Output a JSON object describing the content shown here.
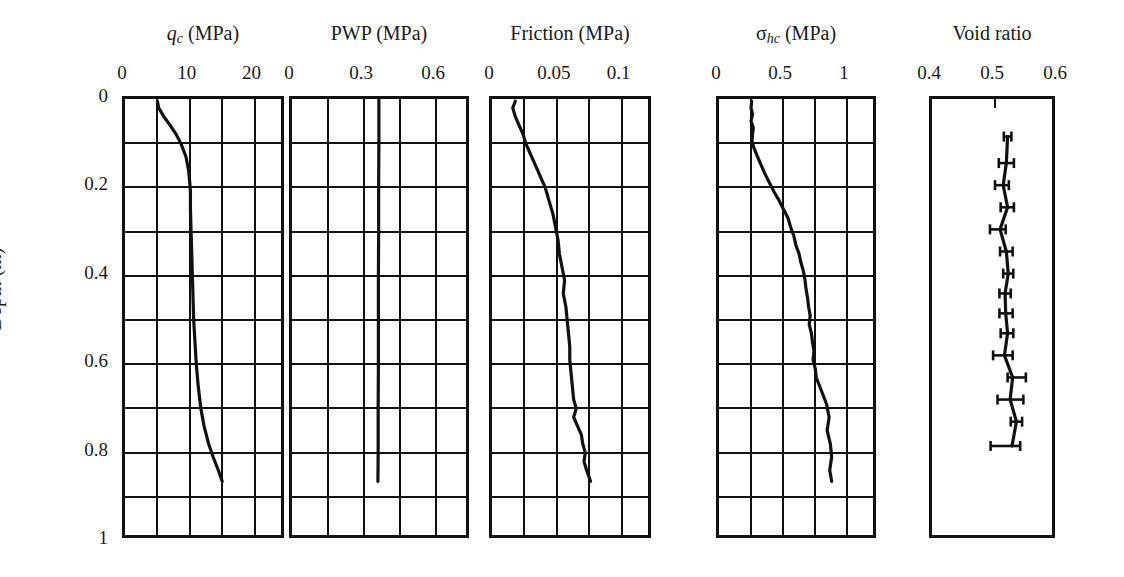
{
  "figure": {
    "y_axis_title": "Depth (m)",
    "y_ticks": [
      "0",
      "0.2",
      "0.4",
      "0.6",
      "0.8",
      "1"
    ],
    "y_tick_values": [
      0,
      0.2,
      0.4,
      0.6,
      0.8,
      1.0
    ]
  },
  "panels": [
    {
      "key": "qc",
      "title_html": "qc (MPa)",
      "title_main": "q",
      "title_sub": "c",
      "title_unit": " (MPa)",
      "x_ticks": [
        "0",
        "10",
        "20"
      ],
      "x_tick_values": [
        0,
        10,
        20
      ],
      "x_min": 0,
      "x_max": 25,
      "grid_x_step": 5,
      "grid_y_step": 0.1
    },
    {
      "key": "pwp",
      "title_html": "PWP (MPa)",
      "title_main": "PWP",
      "title_sub": "",
      "title_unit": " (MPa)",
      "x_ticks": [
        "0",
        "0.3",
        "0.6"
      ],
      "x_tick_values": [
        0,
        0.3,
        0.6
      ],
      "x_min": 0,
      "x_max": 0.75,
      "grid_x_step": 0.15,
      "grid_y_step": 0.1
    },
    {
      "key": "friction",
      "title_html": "Friction (MPa)",
      "title_main": "Friction",
      "title_sub": "",
      "title_unit": " (MPa)",
      "x_ticks": [
        "0",
        "0.05",
        "0.1"
      ],
      "x_tick_values": [
        0,
        0.05,
        0.1
      ],
      "x_min": 0,
      "x_max": 0.125,
      "grid_x_step": 0.025,
      "grid_y_step": 0.1
    },
    {
      "key": "sigma_hc",
      "title_html": "σhc (MPa)",
      "title_main": "σ",
      "title_sub": "hc",
      "title_unit": " (MPa)",
      "x_ticks": [
        "0",
        "0.5",
        "1"
      ],
      "x_tick_values": [
        0,
        0.5,
        1
      ],
      "x_min": 0,
      "x_max": 1.25,
      "grid_x_step": 0.25,
      "grid_y_step": 0.1
    },
    {
      "key": "void_ratio",
      "title_html": "Void ratio",
      "title_main": "Void ratio",
      "title_sub": "",
      "title_unit": "",
      "x_ticks": [
        "0.4",
        "0.5",
        "0.6"
      ],
      "x_tick_values": [
        0.4,
        0.5,
        0.6
      ],
      "x_min": 0.4,
      "x_max": 0.6,
      "grid_x_step": 0,
      "grid_y_step": 0
    }
  ],
  "chart_data": [
    {
      "type": "line",
      "title": "qc (MPa)",
      "xlabel": "qc (MPa)",
      "ylabel": "Depth (m)",
      "xlim": [
        0,
        25
      ],
      "ylim": [
        0,
        1
      ],
      "y_inverted": true,
      "grid": true,
      "xticks": [
        0,
        10,
        20
      ],
      "yticks": [
        0,
        0.2,
        0.4,
        0.6,
        0.8,
        1
      ],
      "series": [
        {
          "name": "qc",
          "depth": [
            0.005,
            0.02,
            0.04,
            0.06,
            0.08,
            0.1,
            0.13,
            0.16,
            0.19,
            0.21,
            0.25,
            0.3,
            0.35,
            0.4,
            0.45,
            0.5,
            0.55,
            0.6,
            0.65,
            0.7,
            0.74,
            0.78,
            0.81,
            0.84,
            0.865
          ],
          "values": [
            5.0,
            5.2,
            6.0,
            7.0,
            7.9,
            8.6,
            9.4,
            9.8,
            10.0,
            10.1,
            10.1,
            10.2,
            10.3,
            10.4,
            10.5,
            10.6,
            10.8,
            11.0,
            11.3,
            11.7,
            12.2,
            12.9,
            13.6,
            14.4,
            15.0
          ]
        }
      ]
    },
    {
      "type": "line",
      "title": "PWP (MPa)",
      "xlabel": "PWP (MPa)",
      "ylabel": "Depth (m)",
      "xlim": [
        0,
        0.75
      ],
      "ylim": [
        0,
        1
      ],
      "y_inverted": true,
      "grid": true,
      "xticks": [
        0,
        0.3,
        0.6
      ],
      "yticks": [
        0,
        0.2,
        0.4,
        0.6,
        0.8,
        1
      ],
      "series": [
        {
          "name": "PWP",
          "depth": [
            0.0,
            0.1,
            0.2,
            0.3,
            0.4,
            0.5,
            0.6,
            0.7,
            0.8,
            0.865
          ],
          "values": [
            0.362,
            0.362,
            0.361,
            0.361,
            0.36,
            0.36,
            0.36,
            0.359,
            0.359,
            0.358
          ]
        }
      ]
    },
    {
      "type": "line",
      "title": "Friction (MPa)",
      "xlabel": "Friction (MPa)",
      "ylabel": "Depth (m)",
      "xlim": [
        0,
        0.125
      ],
      "ylim": [
        0,
        1
      ],
      "y_inverted": true,
      "grid": true,
      "xticks": [
        0,
        0.05,
        0.1
      ],
      "yticks": [
        0,
        0.2,
        0.4,
        0.6,
        0.8,
        1
      ],
      "series": [
        {
          "name": "Friction",
          "depth": [
            0.005,
            0.02,
            0.04,
            0.06,
            0.08,
            0.1,
            0.12,
            0.14,
            0.16,
            0.18,
            0.2,
            0.23,
            0.26,
            0.29,
            0.32,
            0.35,
            0.38,
            0.41,
            0.44,
            0.47,
            0.5,
            0.53,
            0.56,
            0.59,
            0.62,
            0.65,
            0.68,
            0.7,
            0.72,
            0.74,
            0.76,
            0.78,
            0.8,
            0.82,
            0.84,
            0.865
          ],
          "values": [
            0.018,
            0.016,
            0.018,
            0.021,
            0.024,
            0.026,
            0.029,
            0.032,
            0.035,
            0.038,
            0.041,
            0.044,
            0.047,
            0.049,
            0.051,
            0.052,
            0.054,
            0.056,
            0.055,
            0.057,
            0.058,
            0.059,
            0.06,
            0.06,
            0.061,
            0.062,
            0.063,
            0.065,
            0.063,
            0.066,
            0.069,
            0.07,
            0.072,
            0.071,
            0.073,
            0.076
          ]
        }
      ]
    },
    {
      "type": "line",
      "title": "σhc (MPa)",
      "xlabel": "σhc (MPa)",
      "ylabel": "Depth (m)",
      "xlim": [
        0,
        1.25
      ],
      "ylim": [
        0,
        1
      ],
      "y_inverted": true,
      "grid": true,
      "xticks": [
        0,
        0.5,
        1
      ],
      "yticks": [
        0,
        0.2,
        0.4,
        0.6,
        0.8,
        1
      ],
      "series": [
        {
          "name": "sigma_hc",
          "depth": [
            0.005,
            0.02,
            0.035,
            0.05,
            0.065,
            0.08,
            0.095,
            0.11,
            0.13,
            0.15,
            0.17,
            0.19,
            0.21,
            0.23,
            0.25,
            0.27,
            0.29,
            0.31,
            0.33,
            0.35,
            0.37,
            0.39,
            0.41,
            0.43,
            0.45,
            0.47,
            0.49,
            0.51,
            0.53,
            0.55,
            0.57,
            0.59,
            0.61,
            0.63,
            0.66,
            0.69,
            0.72,
            0.75,
            0.78,
            0.81,
            0.84,
            0.865
          ],
          "values": [
            0.255,
            0.25,
            0.262,
            0.25,
            0.268,
            0.262,
            0.258,
            0.272,
            0.3,
            0.33,
            0.36,
            0.395,
            0.43,
            0.47,
            0.505,
            0.54,
            0.56,
            0.585,
            0.6,
            0.625,
            0.64,
            0.66,
            0.672,
            0.68,
            0.692,
            0.7,
            0.712,
            0.705,
            0.722,
            0.73,
            0.742,
            0.735,
            0.752,
            0.76,
            0.8,
            0.84,
            0.86,
            0.845,
            0.87,
            0.88,
            0.865,
            0.88
          ]
        }
      ]
    },
    {
      "type": "scatter",
      "title": "Void ratio",
      "xlabel": "Void ratio",
      "ylabel": "Depth (m)",
      "xlim": [
        0.4,
        0.6
      ],
      "ylim": [
        0,
        1
      ],
      "y_inverted": true,
      "grid": false,
      "xticks": [
        0.4,
        0.5,
        0.6
      ],
      "yticks": [
        0,
        0.2,
        0.4,
        0.6,
        0.8,
        1
      ],
      "error_bars": "horizontal",
      "series": [
        {
          "name": "Void ratio",
          "depth": [
            0.085,
            0.145,
            0.195,
            0.245,
            0.295,
            0.345,
            0.395,
            0.44,
            0.485,
            0.53,
            0.58,
            0.63,
            0.68,
            0.73,
            0.785
          ],
          "values": [
            0.52,
            0.518,
            0.513,
            0.52,
            0.508,
            0.518,
            0.521,
            0.516,
            0.517,
            0.52,
            0.515,
            0.528,
            0.524,
            0.534,
            0.527
          ],
          "err_low": [
            0.006,
            0.012,
            0.013,
            0.011,
            0.016,
            0.01,
            0.008,
            0.009,
            0.01,
            0.011,
            0.018,
            0.008,
            0.02,
            0.009,
            0.034
          ],
          "err_high": [
            0.006,
            0.012,
            0.009,
            0.01,
            0.009,
            0.01,
            0.008,
            0.009,
            0.011,
            0.009,
            0.013,
            0.021,
            0.021,
            0.009,
            0.013
          ]
        }
      ]
    }
  ]
}
